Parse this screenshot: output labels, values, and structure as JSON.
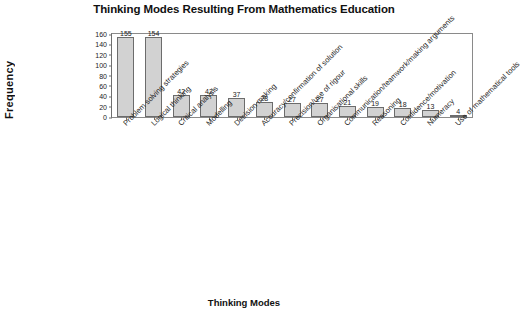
{
  "chart_data": {
    "type": "bar",
    "title": "Thinking Modes Resulting From Mathematics Education",
    "xlabel": "Thinking Modes",
    "ylabel": "Frequency",
    "ylim": [
      0,
      160
    ],
    "yticks": [
      0,
      20,
      40,
      60,
      80,
      100,
      120,
      140,
      160
    ],
    "grid": false,
    "legend": null,
    "categories": [
      "Problem solving strategies",
      "Logical thinking",
      "Critical analysis",
      "Modelling",
      "Decision making",
      "Accuracy/confirmation of solution",
      "Precision/use of rigour",
      "Organisational skills",
      "Communication/teamwork/making arguments",
      "Reasoning",
      "Confidence/motivation",
      "Numeracy",
      "Use of mathematical tools"
    ],
    "values": [
      155,
      154,
      42,
      42,
      37,
      28,
      27,
      27,
      21,
      19,
      18,
      13,
      4
    ],
    "bar_fill_color": "#d2d2d2",
    "bar_border_color": "#6c6c6c",
    "axis_color": "#6f6f6f",
    "text_color": "#1a1a1a"
  }
}
